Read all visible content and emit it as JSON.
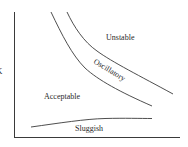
{
  "diagram": {
    "type": "region-diagram",
    "y_axis_label": "K",
    "x_axis_label": "",
    "regions": [
      {
        "name": "unstable",
        "label": "Unstable"
      },
      {
        "name": "oscillatory",
        "label": "Oscillatory"
      },
      {
        "name": "acceptable",
        "label": "Acceptable"
      },
      {
        "name": "sluggish",
        "label": "Sluggish"
      }
    ],
    "colors": {
      "line": "#3a3a3a",
      "text": "#2a2a2a",
      "background": "#ffffff"
    }
  }
}
